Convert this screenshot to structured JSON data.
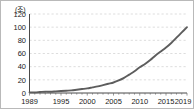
{
  "chart_data": {
    "type": "line",
    "title": "",
    "subtitle": "",
    "xlabel": "년",
    "ylabel": "조",
    "yunit_label": "(조)",
    "xunit_label": "(년)",
    "xlim": [
      1989,
      2019
    ],
    "ylim": [
      0,
      120
    ],
    "grid": true,
    "legend": null,
    "ytick_labels": [
      "0",
      "20",
      "40",
      "60",
      "80",
      "100",
      "120"
    ],
    "ytick_values": [
      0,
      20,
      40,
      60,
      80,
      100,
      120
    ],
    "xtick_labels": [
      "1989",
      "1995",
      "2000",
      "2005",
      "2010",
      "2015",
      "2019"
    ],
    "xtick_values": [
      1989,
      1995,
      2000,
      2005,
      2010,
      2015,
      2019
    ],
    "xaxis_last_label_suffix": "(년)",
    "series": [
      {
        "name": "",
        "color": "#5d5d5d",
        "x": [
          1989,
          1990,
          1991,
          1992,
          1993,
          1994,
          1995,
          1996,
          1997,
          1998,
          1999,
          2000,
          2001,
          2002,
          2003,
          2004,
          2005,
          2006,
          2007,
          2008,
          2009,
          2010,
          2011,
          2012,
          2013,
          2014,
          2015,
          2016,
          2017,
          2018,
          2019
        ],
        "values": [
          1,
          1,
          1.5,
          2,
          2,
          2.5,
          3,
          3.5,
          4,
          5,
          6,
          7,
          8.5,
          10,
          12,
          14,
          16,
          19,
          23,
          28,
          33,
          39,
          44,
          50,
          57,
          63,
          69,
          76,
          84,
          92,
          100
        ]
      }
    ],
    "annotations": []
  }
}
